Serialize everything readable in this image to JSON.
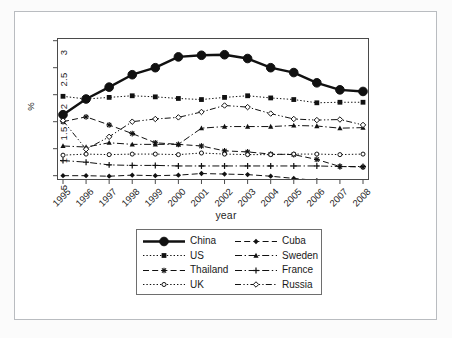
{
  "figure": {
    "xaxis_title": "year",
    "yaxis_title": "%"
  },
  "axes": {
    "y_ticks": [
      "5",
      "1",
      "1.5",
      "2",
      "2.5",
      "3"
    ],
    "y_tick_values": [
      0.5,
      1.0,
      1.5,
      2.0,
      2.5,
      3.0
    ],
    "x_ticks": [
      "1995",
      "1996",
      "1997",
      "1998",
      "1999",
      "2000",
      "2001",
      "2002",
      "2003",
      "2004",
      "2005",
      "2006",
      "2007",
      "2008"
    ]
  },
  "legend": {
    "items": [
      {
        "label": "China",
        "marker": "circle-filled",
        "line": "solid",
        "column": "left",
        "row": 1
      },
      {
        "label": "US",
        "marker": "square-filled",
        "line": "dotted",
        "column": "left",
        "row": 2
      },
      {
        "label": "Thailand",
        "marker": "star",
        "line": "dashed",
        "column": "left",
        "row": 3
      },
      {
        "label": "UK",
        "marker": "circle-open",
        "line": "dotted",
        "column": "left",
        "row": 4
      },
      {
        "label": "Cuba",
        "marker": "diamond-filled",
        "line": "dashed",
        "column": "right",
        "row": 1
      },
      {
        "label": "Sweden",
        "marker": "triangle-filled",
        "line": "dash-dot",
        "column": "right",
        "row": 2
      },
      {
        "label": "France",
        "marker": "plus",
        "line": "dash-dot",
        "column": "right",
        "row": 3
      },
      {
        "label": "Russia",
        "marker": "diamond-open",
        "line": "dash-dot-dot",
        "column": "right",
        "row": 4
      }
    ]
  },
  "chart_data": {
    "type": "line",
    "title": "",
    "subtitle": "",
    "xlabel": "year",
    "ylabel": "%",
    "x": [
      "1995",
      "1996",
      "1997",
      "1998",
      "1999",
      "2000",
      "2001",
      "2002",
      "2003",
      "2004",
      "2005",
      "2006",
      "2007",
      "2008"
    ],
    "xlim": [
      1995,
      2008
    ],
    "ylim": [
      0.42,
      3.05
    ],
    "ytick_labels": [
      "5",
      "1",
      "1.5",
      "2",
      "2.5",
      "3"
    ],
    "ytick_values": [
      0.5,
      1.0,
      1.5,
      2.0,
      2.5,
      3.0
    ],
    "grid": false,
    "legend_position": "bottom-center",
    "series": [
      {
        "name": "China",
        "marker": "circle-filled",
        "line": "solid",
        "lw": 2.4,
        "values": [
          1.63,
          1.92,
          2.14,
          2.37,
          2.5,
          2.7,
          2.73,
          2.74,
          2.67,
          2.5,
          2.41,
          2.22,
          2.09,
          2.06
        ]
      },
      {
        "name": "US",
        "marker": "square-filled",
        "line": "dotted",
        "lw": 1.0,
        "values": [
          1.97,
          1.92,
          1.95,
          1.98,
          1.96,
          1.93,
          1.91,
          1.95,
          1.98,
          1.94,
          1.91,
          1.85,
          1.86,
          1.86
        ]
      },
      {
        "name": "Thailand",
        "marker": "star",
        "line": "dashed",
        "lw": 1.0,
        "values": [
          1.5,
          1.59,
          1.44,
          1.28,
          1.11,
          1.08,
          1.05,
          0.96,
          0.94,
          0.9,
          0.89,
          0.8,
          0.67,
          0.66
        ]
      },
      {
        "name": "UK",
        "marker": "circle-open",
        "line": "dotted",
        "lw": 1.0,
        "values": [
          0.88,
          0.9,
          0.89,
          0.9,
          0.9,
          0.89,
          0.92,
          0.9,
          0.89,
          0.89,
          0.9,
          0.9,
          0.89,
          0.9
        ]
      },
      {
        "name": "Cuba",
        "marker": "diamond-filled",
        "line": "dashed",
        "lw": 1.0,
        "values": [
          0.5,
          0.5,
          0.49,
          0.51,
          0.5,
          0.51,
          0.54,
          0.53,
          0.52,
          0.49,
          0.45,
          0.41,
          0.37,
          0.36
        ]
      },
      {
        "name": "Sweden",
        "marker": "triangle-filled",
        "line": "dash-dot",
        "lw": 1.0,
        "values": [
          1.05,
          1.03,
          1.11,
          1.08,
          1.08,
          1.08,
          1.38,
          1.41,
          1.41,
          1.41,
          1.43,
          1.42,
          1.38,
          1.39
        ]
      },
      {
        "name": "France",
        "marker": "plus",
        "line": "dash-dot",
        "lw": 1.0,
        "values": [
          0.78,
          0.75,
          0.7,
          0.69,
          0.69,
          0.68,
          0.68,
          0.68,
          0.68,
          0.68,
          0.68,
          0.68,
          0.67,
          0.67
        ]
      },
      {
        "name": "Russia",
        "marker": "diamond-open",
        "line": "dash-dot-dot",
        "lw": 1.0,
        "values": [
          1.52,
          0.99,
          1.22,
          1.5,
          1.55,
          1.58,
          1.68,
          1.8,
          1.77,
          1.65,
          1.55,
          1.53,
          1.54,
          1.44
        ]
      }
    ]
  }
}
